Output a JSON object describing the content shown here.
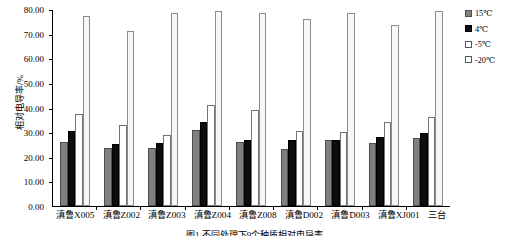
{
  "chart_data": {
    "type": "bar",
    "title": "",
    "xlabel": "",
    "ylabel": "相对电导率/%",
    "ylim": [
      0,
      80
    ],
    "yticks": [
      "0.00",
      "10.00",
      "20.00",
      "30.00",
      "40.00",
      "50.00",
      "60.00",
      "70.00",
      "80.00"
    ],
    "ytick_values": [
      0,
      10,
      20,
      30,
      40,
      50,
      60,
      70,
      80
    ],
    "grid": false,
    "legend_position": "right",
    "categories": [
      "滇鲁X005",
      "滇鲁Z002",
      "滇鲁Z003",
      "滇鲁Z004",
      "滇鲁Z008",
      "滇鲁D002",
      "滇鲁D003",
      "滇鲁XJ001",
      "三台"
    ],
    "series": [
      {
        "name": "15℃",
        "color": "#808080",
        "values": [
          26.0,
          23.5,
          23.5,
          31.0,
          26.0,
          23.0,
          27.0,
          25.5,
          27.5
        ]
      },
      {
        "name": "4℃",
        "color": "#0d0d0d",
        "values": [
          30.5,
          25.0,
          25.5,
          34.0,
          27.0,
          27.0,
          27.0,
          28.0,
          29.5
        ]
      },
      {
        "name": "-5℃",
        "color": "#ffffff",
        "values": [
          37.5,
          33.0,
          29.0,
          41.0,
          39.0,
          30.5,
          30.0,
          34.0,
          36.0
        ]
      },
      {
        "name": "-20℃",
        "color": "#f7f7f7",
        "values": [
          77.0,
          71.0,
          78.5,
          79.0,
          78.5,
          76.0,
          78.5,
          73.5,
          79.0
        ]
      }
    ]
  },
  "legend": {
    "items": [
      {
        "label": "15℃"
      },
      {
        "label": "4℃"
      },
      {
        "label": "-5℃"
      },
      {
        "label": "-20℃"
      }
    ]
  },
  "caption": {
    "text": "图1  不同处理下9个种质相对电导率"
  }
}
